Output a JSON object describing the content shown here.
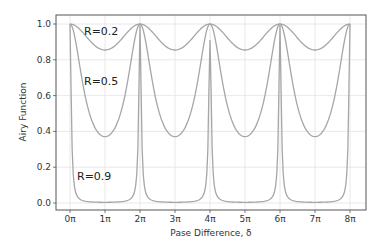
{
  "chart_data": {
    "type": "line",
    "title": "",
    "xlabel": "Pase Difference, δ",
    "ylabel": "Airy Function",
    "xlim_pi": [
      -0.4,
      8.45
    ],
    "ylim": [
      -0.045,
      1.05
    ],
    "grid": true,
    "legend": "none (inline annotations)",
    "x_ticks": [
      "0π",
      "1π",
      "2π",
      "3π",
      "4π",
      "5π",
      "6π",
      "7π",
      "8π"
    ],
    "x_tick_values_pi": [
      0,
      1,
      2,
      3,
      4,
      5,
      6,
      7,
      8
    ],
    "y_ticks": [
      "0.0",
      "0.2",
      "0.4",
      "0.6",
      "0.8",
      "1.0"
    ],
    "y_tick_values": [
      0.0,
      0.2,
      0.4,
      0.6,
      0.8,
      1.0
    ],
    "formula": "I(δ) = 1 / (1 + F·sin²(δ/2))",
    "series": [
      {
        "name": "R=0.2",
        "F": 0.17,
        "min": 0.85,
        "max": 1.0,
        "color": "#a6a6a6"
      },
      {
        "name": "R=0.5",
        "F": 1.7,
        "min": 0.37,
        "max": 1.0,
        "color": "#a6a6a6"
      },
      {
        "name": "R=0.9",
        "F": 250,
        "min": 0.004,
        "max": 1.0,
        "color": "#a6a6a6",
        "note": "peak at 4π rendered to ~0.91 due to sampling"
      }
    ],
    "annotations": [
      {
        "text": "R=0.2",
        "x_pi": 0.4,
        "y": 0.96
      },
      {
        "text": "R=0.5",
        "x_pi": 0.4,
        "y": 0.68
      },
      {
        "text": "R=0.9",
        "x_pi": 0.2,
        "y": 0.15
      }
    ],
    "peaks_pi": [
      0,
      2,
      4,
      6,
      8
    ]
  }
}
